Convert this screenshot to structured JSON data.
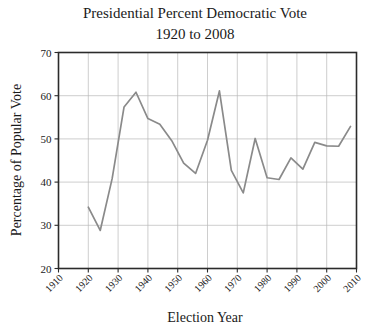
{
  "chart_data": {
    "type": "line",
    "title": "Presidential Percent Democratic Vote",
    "subtitle": "1920 to 2008",
    "xlabel": "Election Year",
    "ylabel": "Percentage of Popular Vote",
    "xlim": [
      1910,
      2010
    ],
    "ylim": [
      20,
      70
    ],
    "xticks": [
      1910,
      1920,
      1930,
      1940,
      1950,
      1960,
      1970,
      1980,
      1990,
      2000,
      2010
    ],
    "yticks": [
      20,
      30,
      40,
      50,
      60,
      70
    ],
    "grid": true,
    "legend": "none",
    "line_color": "#8a8a8a",
    "x": [
      1920,
      1924,
      1928,
      1932,
      1936,
      1940,
      1944,
      1948,
      1952,
      1956,
      1960,
      1964,
      1968,
      1972,
      1976,
      1980,
      1984,
      1988,
      1992,
      1996,
      2000,
      2004,
      2008
    ],
    "values": [
      34.2,
      28.8,
      40.8,
      57.4,
      60.8,
      54.7,
      53.4,
      49.6,
      44.4,
      42.0,
      49.7,
      61.1,
      42.7,
      37.5,
      50.1,
      41.0,
      40.6,
      45.6,
      43.0,
      49.2,
      48.4,
      48.3,
      52.9
    ],
    "series": [
      {
        "name": "Democratic percent of popular vote",
        "values": [
          34.2,
          28.8,
          40.8,
          57.4,
          60.8,
          54.7,
          53.4,
          49.6,
          44.4,
          42.0,
          49.7,
          61.1,
          42.7,
          37.5,
          50.1,
          41.0,
          40.6,
          45.6,
          43.0,
          49.2,
          48.4,
          48.3,
          52.9
        ]
      }
    ]
  },
  "axis": {
    "y_tick_labels": [
      "70",
      "60",
      "50",
      "40",
      "30",
      "20"
    ],
    "x_tick_labels": [
      "1910",
      "1920",
      "1930",
      "1940",
      "1950",
      "1960",
      "1970",
      "1980",
      "1990",
      "2000",
      "2010"
    ]
  }
}
